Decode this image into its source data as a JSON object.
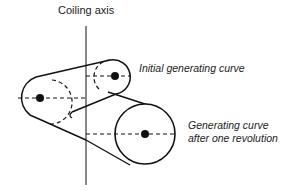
{
  "diagram": {
    "axis_label": "Coiling axis",
    "initial_label": "Initial generating curve",
    "after_label_line1": "Generating curve",
    "after_label_line2": "after one revolution",
    "colors": {
      "stroke": "#111111",
      "text": "#222222",
      "background": "#ffffff"
    }
  }
}
